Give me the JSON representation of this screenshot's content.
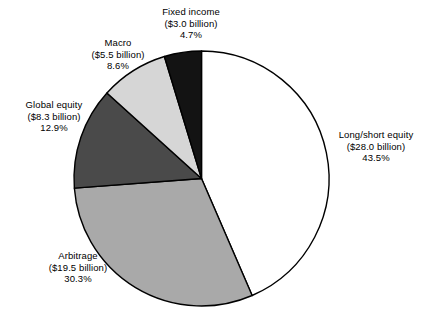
{
  "chart_data": {
    "type": "pie",
    "title": "",
    "subtitle": "",
    "xlabel": "",
    "ylabel": "",
    "legend_position": "none",
    "grid": false,
    "units": "billion USD",
    "total_value": 64.3,
    "start_angle_deg": 0,
    "direction": "clockwise",
    "categories": [
      "Long/short equity",
      "Arbitrage",
      "Global equity",
      "Macro",
      "Fixed income"
    ],
    "values": [
      28.0,
      19.5,
      8.3,
      5.5,
      3.0
    ],
    "percentages": [
      43.5,
      30.3,
      12.9,
      8.6,
      4.7
    ],
    "colors": [
      "#ffffff",
      "#a9a9a9",
      "#4a4a4a",
      "#d6d6d6",
      "#131313"
    ],
    "slices": [
      {
        "name": "Long/short equity",
        "value": 28.0,
        "value_text": "($28.0 billion)",
        "percent": 43.5,
        "percent_text": "43.5%",
        "color": "#ffffff"
      },
      {
        "name": "Arbitrage",
        "value": 19.5,
        "value_text": "($19.5 billion)",
        "percent": 30.3,
        "percent_text": "30.3%",
        "color": "#a9a9a9"
      },
      {
        "name": "Global equity",
        "value": 8.3,
        "value_text": "($8.3 billion)",
        "percent": 12.9,
        "percent_text": "12.9%",
        "color": "#4a4a4a"
      },
      {
        "name": "Macro",
        "value": 5.5,
        "value_text": "($5.5 billion)",
        "percent": 8.6,
        "percent_text": "8.6%",
        "color": "#d6d6d6"
      },
      {
        "name": "Fixed income",
        "value": 3.0,
        "value_text": "($3.0 billion)",
        "percent": 4.7,
        "percent_text": "4.7%",
        "color": "#131313"
      }
    ],
    "stroke_color": "#000000"
  },
  "labels": {
    "fixed_income": {
      "name": "Fixed income",
      "value_text": "($3.0 billion)",
      "percent_text": "4.7%"
    },
    "macro": {
      "name": "Macro",
      "value_text": "($5.5 billion)",
      "percent_text": "8.6%"
    },
    "global_equity": {
      "name": "Global equity",
      "value_text": "($8.3 billion)",
      "percent_text": "12.9%"
    },
    "arbitrage": {
      "name": "Arbitrage",
      "value_text": "($19.5 billion)",
      "percent_text": "30.3%"
    },
    "long_short_equity": {
      "name": "Long/short equity",
      "value_text": "($28.0 billion)",
      "percent_text": "43.5%"
    }
  }
}
